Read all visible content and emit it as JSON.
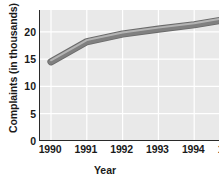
{
  "chart_data": {
    "type": "line",
    "title": "",
    "xlabel": "Year",
    "ylabel": "Complaints (in thousands)",
    "categories": [
      "1990",
      "1991",
      "1992",
      "1993",
      "1994",
      "1995"
    ],
    "x": [
      1990,
      1991,
      1992,
      1993,
      1994,
      1995
    ],
    "values": [
      14.5,
      18.2,
      19.6,
      20.5,
      21.3,
      22.4
    ],
    "series": [
      {
        "name": "Complaints",
        "values": [
          14.5,
          18.2,
          19.6,
          20.5,
          21.3,
          22.4
        ]
      }
    ],
    "xlim": [
      1990,
      1995
    ],
    "ylim": [
      0,
      24
    ],
    "ytick_labels": [
      "0",
      "5",
      "10",
      "15",
      "20"
    ],
    "ytick_values": [
      0,
      5,
      10,
      15,
      20
    ],
    "xtick_labels": [
      "1990",
      "1991",
      "1992",
      "1993",
      "1994",
      "1995"
    ],
    "grid": true,
    "grid_color": "#ffffff",
    "legend": false,
    "legend_position": "none",
    "plot_background": "#e9e9e9",
    "figure_background": "#ffffff",
    "line_color": "#808080",
    "line_edge_color": "#6a6a6a",
    "line_highlight_color": "#b4b4b4",
    "axis_color": "#2a2a2a",
    "text_color": "#1a1a1a"
  }
}
